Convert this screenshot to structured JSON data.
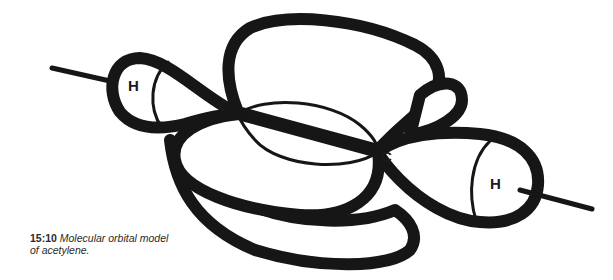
{
  "figure": {
    "title": "Molecular orbital model of acetylene",
    "atoms": [
      {
        "label": "H",
        "position": "left"
      },
      {
        "label": "C",
        "position": "left-center"
      },
      {
        "label": "C",
        "position": "right-center"
      },
      {
        "label": "H",
        "position": "right"
      }
    ],
    "colors": {
      "stroke": "#161616",
      "background": "#ffffff"
    }
  },
  "caption": {
    "number": "15:10",
    "text_line1": "Molecular orbital model",
    "text_line2": "of acetylene."
  }
}
